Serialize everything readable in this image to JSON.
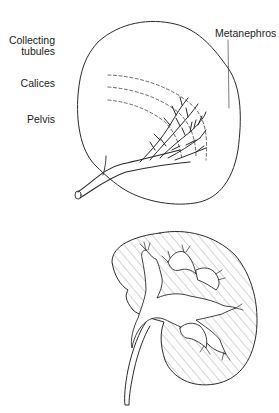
{
  "diagram": {
    "type": "anatomical-illustration",
    "top_figure": {
      "labels": {
        "collecting_tubules": "Collecting\ntubules",
        "collecting_line1": "Collecting",
        "collecting_line2": "tubules",
        "calices": "Calices",
        "pelvis": "Pelvis",
        "metanephros": "Metanephros"
      }
    },
    "bottom_figure": {
      "description": "sectioned adult kidney with hatched parenchyma, renal pelvis, calices and ureter"
    },
    "colors": {
      "line": "#2a2a2a",
      "hatch": "#8a8a8a",
      "background": "#ffffff"
    }
  }
}
